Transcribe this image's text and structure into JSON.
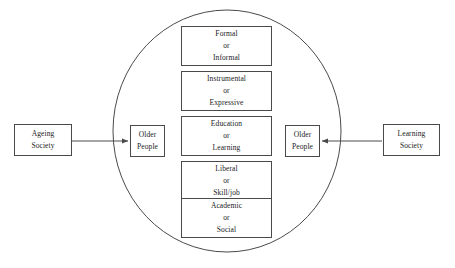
{
  "diagram": {
    "background_color": "#ffffff",
    "stroke_color": "#4a4a4a",
    "text_color": "#1a1a1a",
    "container": {
      "shape": "ellipse",
      "name": "older-people-learning-domain"
    },
    "left_source": {
      "line1": "Ageing",
      "line2": "Society"
    },
    "left_target": {
      "line1": "Older",
      "line2": "People"
    },
    "right_target": {
      "line1": "Older",
      "line2": "People"
    },
    "right_source": {
      "line1": "Learning",
      "line2": "Society"
    },
    "connector_left": {
      "name": "arrow-ageing-to-older-people",
      "direction": "right"
    },
    "connector_right": {
      "name": "arrow-learning-to-older-people",
      "direction": "left"
    },
    "dimensions": [
      {
        "id": "formal",
        "line1": "Formal",
        "line2": "or",
        "line3": "Informal"
      },
      {
        "id": "instrumental",
        "line1": "Instrumental",
        "line2": "or",
        "line3": "Expressive"
      },
      {
        "id": "education",
        "line1": "Education",
        "line2": "or",
        "line3": "Learning"
      },
      {
        "id": "liberal",
        "line1": "Liberal",
        "line2": "or",
        "line3": "Skill/job"
      },
      {
        "id": "academic",
        "line1": "Academic",
        "line2": "or",
        "line3": "Social"
      }
    ]
  }
}
